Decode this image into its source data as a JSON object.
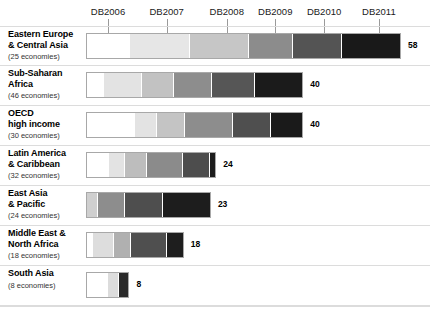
{
  "top_caption": "(partially cropped caption line)",
  "chart_data": {
    "type": "bar",
    "title": "",
    "subtitle": "",
    "xlabel": "",
    "ylabel": "",
    "orientation": "horizontal",
    "stacked": true,
    "grid": false,
    "legend_position": "top",
    "axis": {
      "ticks": [
        {
          "label": "DB2006",
          "x_pct": 7.0
        },
        {
          "label": "DB2007",
          "x_pct": 25.6
        },
        {
          "label": "DB2008",
          "x_pct": 44.7
        },
        {
          "label": "DB2009",
          "x_pct": 60.1
        },
        {
          "label": "DB2010",
          "x_pct": 75.6
        },
        {
          "label": "DB2011",
          "x_pct": 93.0
        }
      ]
    },
    "series": [
      {
        "name": "DB2006",
        "color": "#ffffff"
      },
      {
        "name": "DB2007",
        "color": "#e3e3e3"
      },
      {
        "name": "DB2008",
        "color": "#c4c4c4"
      },
      {
        "name": "DB2009",
        "color": "#8f8f8f"
      },
      {
        "name": "DB2010",
        "color": "#565656"
      },
      {
        "name": "DB2011",
        "color": "#1c1c1c"
      }
    ],
    "categories": [
      "Eastern Europe & Central Asia",
      "Sub-Saharan Africa",
      "OECD high income",
      "Latin America & Caribbean",
      "East Asia & Pacific",
      "Middle East & North Africa",
      "South Asia"
    ],
    "values": [
      58,
      40,
      40,
      24,
      23,
      18,
      8
    ]
  },
  "rows": [
    {
      "name_line1": "Eastern Europe",
      "name_line2": "& Central Asia",
      "economies": "(25 economies)",
      "total": "58",
      "segments": [
        {
          "series": "DB2006",
          "value": 8,
          "color": "#ffffff"
        },
        {
          "series": "DB2007",
          "value": 11,
          "color": "#e6e6e6"
        },
        {
          "series": "DB2008",
          "value": 11,
          "color": "#c6c6c6"
        },
        {
          "series": "DB2009",
          "value": 8,
          "color": "#8c8c8c"
        },
        {
          "series": "DB2010",
          "value": 9,
          "color": "#545454"
        },
        {
          "series": "DB2011",
          "value": 11,
          "color": "#191919"
        }
      ]
    },
    {
      "name_line1": "Sub-Saharan",
      "name_line2": "Africa",
      "economies": "(46 economies)",
      "total": "40",
      "segments": [
        {
          "series": "DB2006",
          "value": 3,
          "color": "#ffffff"
        },
        {
          "series": "DB2007",
          "value": 7,
          "color": "#e3e3e3"
        },
        {
          "series": "DB2008",
          "value": 6,
          "color": "#c2c2c2"
        },
        {
          "series": "DB2009",
          "value": 7,
          "color": "#8d8d8d"
        },
        {
          "series": "DB2010",
          "value": 8,
          "color": "#565656"
        },
        {
          "series": "DB2011",
          "value": 9,
          "color": "#1b1b1b"
        }
      ]
    },
    {
      "name_line1": "OECD",
      "name_line2": "high income",
      "economies": "(30 economies)",
      "total": "40",
      "segments": [
        {
          "series": "DB2006",
          "value": 9,
          "color": "#ffffff"
        },
        {
          "series": "DB2007",
          "value": 4,
          "color": "#e3e3e3"
        },
        {
          "series": "DB2008",
          "value": 5,
          "color": "#c4c4c4"
        },
        {
          "series": "DB2009",
          "value": 9,
          "color": "#8d8d8d"
        },
        {
          "series": "DB2010",
          "value": 7,
          "color": "#4f4f4f"
        },
        {
          "series": "DB2011",
          "value": 6,
          "color": "#1a1a1a"
        }
      ]
    },
    {
      "name_line1": "Latin America",
      "name_line2": "& Caribbean",
      "economies": "(32 economies)",
      "total": "24",
      "segments": [
        {
          "series": "DB2006",
          "value": 4,
          "color": "#ffffff"
        },
        {
          "series": "DB2007",
          "value": 3,
          "color": "#e3e3e3"
        },
        {
          "series": "DB2008",
          "value": 4,
          "color": "#bdbdbd"
        },
        {
          "series": "DB2009",
          "value": 7,
          "color": "#8b8b8b"
        },
        {
          "series": "DB2010",
          "value": 5,
          "color": "#4d4d4d"
        },
        {
          "series": "DB2011",
          "value": 1,
          "color": "#1c1c1c"
        }
      ]
    },
    {
      "name_line1": "East Asia",
      "name_line2": "& Pacific",
      "economies": "(24 economies)",
      "total": "23",
      "segments": [
        {
          "series": "DB2007",
          "value": 2,
          "color": "#cfcfcf"
        },
        {
          "series": "DB2008",
          "value": 5,
          "color": "#8d8d8d"
        },
        {
          "series": "DB2009",
          "value": 7,
          "color": "#4e4e4e"
        },
        {
          "series": "DB2010",
          "value": 9,
          "color": "#1d1d1d"
        }
      ]
    },
    {
      "name_line1": "Middle East &",
      "name_line2": "North Africa",
      "economies": "(18 economies)",
      "total": "18",
      "segments": [
        {
          "series": "DB2006",
          "value": 1,
          "color": "#ffffff"
        },
        {
          "series": "DB2007",
          "value": 4,
          "color": "#dddddd"
        },
        {
          "series": "DB2008",
          "value": 3,
          "color": "#b0b0b0"
        },
        {
          "series": "DB2009",
          "value": 7,
          "color": "#4f4f4f"
        },
        {
          "series": "DB2010",
          "value": 3,
          "color": "#1e1e1e"
        }
      ]
    },
    {
      "name_line1": "South Asia",
      "name_line2": "",
      "economies": "(8 economies)",
      "total": "8",
      "segments": [
        {
          "series": "DB2006",
          "value": 4,
          "color": "#ffffff"
        },
        {
          "series": "DB2007",
          "value": 2,
          "color": "#dcdcdc"
        },
        {
          "series": "DB2008",
          "value": 2,
          "color": "#2a2a2a"
        }
      ]
    }
  ]
}
